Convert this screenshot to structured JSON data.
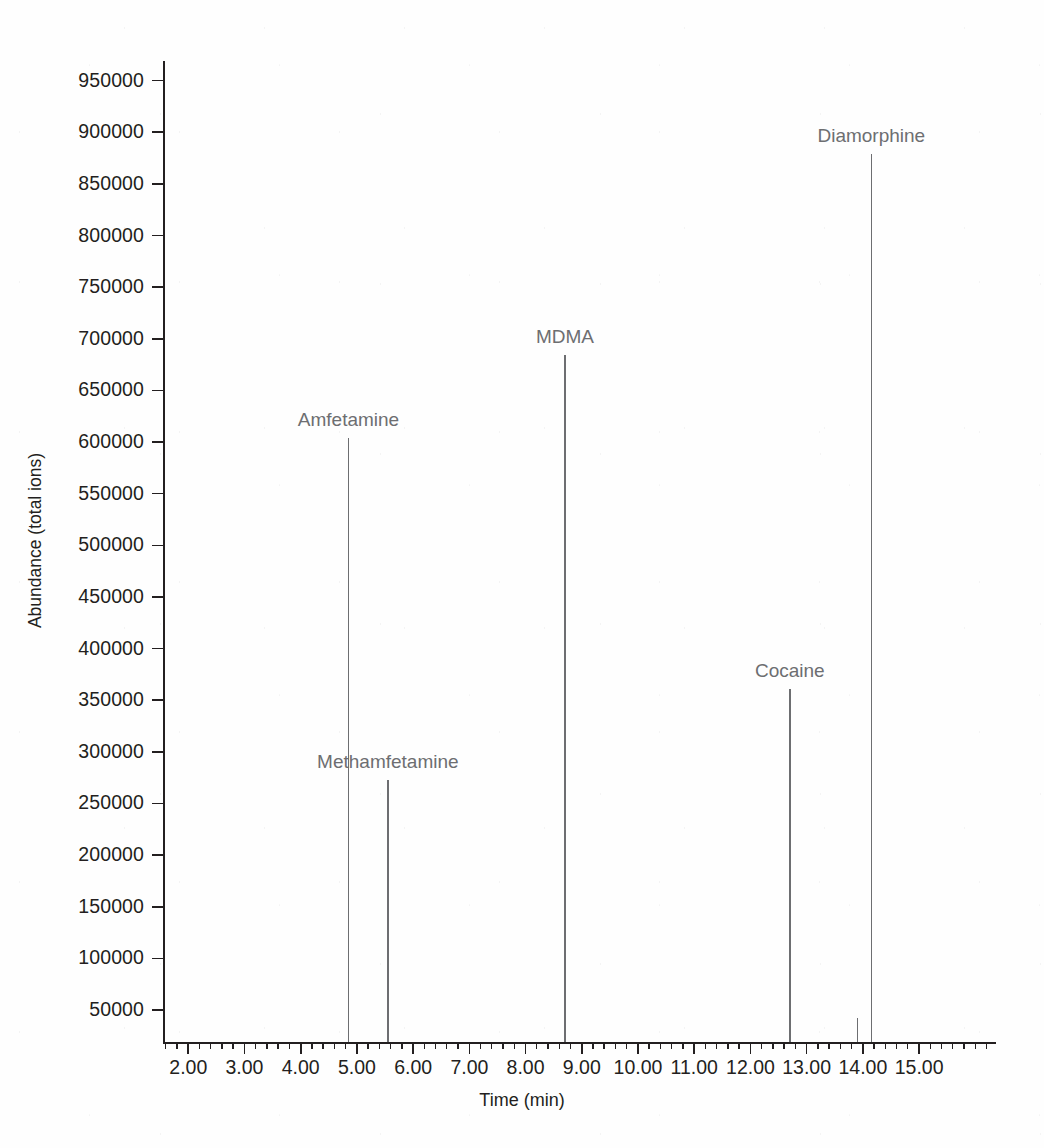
{
  "chart_data": {
    "type": "line",
    "title": "",
    "xlabel": "Time (min)",
    "ylabel": "Abundance (total ions)",
    "xlim": [
      1.55,
      16.35
    ],
    "ylim": [
      19000,
      969000
    ],
    "grid": false,
    "legend": "none",
    "x_major_ticks": [
      2.0,
      3.0,
      4.0,
      5.0,
      6.0,
      7.0,
      8.0,
      9.0,
      10.0,
      11.0,
      12.0,
      13.0,
      14.0,
      15.0
    ],
    "x_tick_labels": [
      "2.00",
      "3.00",
      "4.00",
      "5.00",
      "6.00",
      "7.00",
      "8.00",
      "9.00",
      "10.00",
      "11.00",
      "12.00",
      "13.00",
      "14.00",
      "15.00"
    ],
    "x_minor_tick_interval": 0.2,
    "y_major_ticks": [
      50000,
      100000,
      150000,
      200000,
      250000,
      300000,
      350000,
      400000,
      450000,
      500000,
      550000,
      600000,
      650000,
      700000,
      750000,
      800000,
      850000,
      900000,
      950000
    ],
    "y_tick_labels": [
      "50000",
      "100000",
      "150000",
      "200000",
      "250000",
      "300000",
      "350000",
      "400000",
      "450000",
      "500000",
      "550000",
      "600000",
      "650000",
      "700000",
      "750000",
      "800000",
      "850000",
      "900000",
      "950000"
    ],
    "peaks": [
      {
        "label": "Amfetamine",
        "retention_time": 4.85,
        "abundance": 604000,
        "label_offset_y": -28
      },
      {
        "label": "Methamfetamine",
        "retention_time": 5.55,
        "abundance": 273000,
        "label_offset_y": -28
      },
      {
        "label": "MDMA",
        "retention_time": 8.7,
        "abundance": 684000,
        "label_offset_y": -28
      },
      {
        "label": "Cocaine",
        "retention_time": 12.7,
        "abundance": 361000,
        "label_offset_y": -28
      },
      {
        "label": "Diamorphine",
        "retention_time": 14.15,
        "abundance": 879000,
        "label_offset_y": -28
      },
      {
        "label": "",
        "retention_time": 13.9,
        "abundance": 42000,
        "label_offset_y": -28
      }
    ],
    "colors": {
      "axis": "#231f20",
      "trace": "#6d6e71",
      "label": "#6d6e71",
      "background": "#fefefe"
    }
  }
}
